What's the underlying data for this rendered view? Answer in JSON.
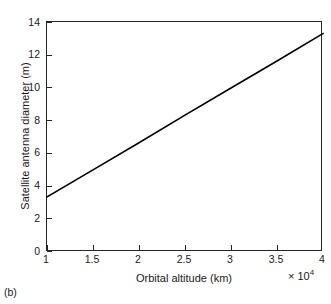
{
  "figure": {
    "subfigure_label": "(b)",
    "background_color": "#ffffff",
    "axis_color": "#262626",
    "line_color": "#000000"
  },
  "chart_data": {
    "type": "line",
    "title": "",
    "xlabel": "Orbital altitude (km)",
    "ylabel": "Satellite antenna diameter (m)",
    "x_exponent_label": "× 10",
    "x_exponent_power": "4",
    "x_multiplier": 10000,
    "xlim": [
      1,
      4
    ],
    "ylim": [
      0,
      14
    ],
    "grid": false,
    "legend": null,
    "xticks": [
      1,
      1.5,
      2,
      2.5,
      3,
      3.5,
      4
    ],
    "xticklabels": [
      "1",
      "1.5",
      "2",
      "2.5",
      "3",
      "3.5",
      "4"
    ],
    "yticks": [
      0,
      2,
      4,
      6,
      8,
      10,
      12,
      14
    ],
    "yticklabels": [
      "0",
      "2",
      "4",
      "6",
      "8",
      "10",
      "12",
      "14"
    ],
    "series": [
      {
        "name": "Satellite antenna diameter",
        "x": [
          1,
          1.5,
          2,
          2.5,
          3,
          3.5,
          4
        ],
        "y": [
          3.35,
          5.0,
          6.65,
          8.33,
          9.98,
          11.63,
          13.3
        ],
        "style": "solid",
        "color": "#000000",
        "width": 1.6
      }
    ]
  }
}
